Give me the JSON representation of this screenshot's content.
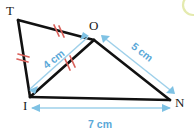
{
  "figure": {
    "type": "geometry-diagram",
    "background_color": "#ffffff",
    "vertices": [
      {
        "id": "T",
        "label": "T",
        "x": 18,
        "y": 20,
        "label_x": 6,
        "label_y": 15
      },
      {
        "id": "O",
        "label": "O",
        "x": 94,
        "y": 40,
        "label_x": 89,
        "label_y": 30
      },
      {
        "id": "I",
        "label": "I",
        "x": 30,
        "y": 97,
        "label_x": 23,
        "label_y": 109
      },
      {
        "id": "N",
        "label": "N",
        "x": 170,
        "y": 100,
        "label_x": 175,
        "label_y": 107
      }
    ],
    "sides": [
      {
        "id": "TO",
        "from": "T",
        "to": "O",
        "tick_count": 2,
        "color": "#111111"
      },
      {
        "id": "TI",
        "from": "T",
        "to": "I",
        "tick_count": 2,
        "color": "#111111"
      },
      {
        "id": "IO",
        "from": "I",
        "to": "O",
        "tick_count": 2,
        "color": "#111111"
      },
      {
        "id": "ON",
        "from": "O",
        "to": "N",
        "tick_count": 0,
        "color": "#111111"
      },
      {
        "id": "IN",
        "from": "I",
        "to": "N",
        "tick_count": 0,
        "color": "#111111"
      }
    ],
    "tick_color": "#d9625c",
    "dimension_color": "#9ed0ea",
    "dimension_text_color": "#5aa8d8",
    "dimensions": [
      {
        "id": "IO",
        "label": "4 cm",
        "value": 4,
        "unit": "cm",
        "text_x": 56,
        "text_y": 62,
        "rotation": -38
      },
      {
        "id": "ON",
        "label": "5 cm",
        "value": 5,
        "unit": "cm",
        "text_x": 140,
        "text_y": 55,
        "rotation": 24
      },
      {
        "id": "IN",
        "label": "7 cm",
        "value": 7,
        "unit": "cm",
        "text_x": 100,
        "text_y": 127,
        "rotation": 0
      }
    ],
    "corner_artifact": {
      "name": "partial-circle-watermark",
      "color": "#cdd86b",
      "cx": 193,
      "cy": 5,
      "r": 10
    }
  }
}
